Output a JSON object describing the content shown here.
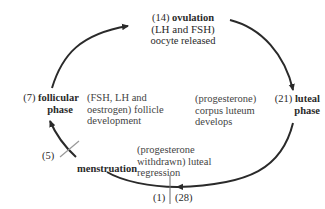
{
  "diagram": {
    "type": "cycle",
    "stages": [
      {
        "id": "ovulation",
        "day": "(14)",
        "name": "ovulation",
        "name_line2": "",
        "hormones": "(LH and FSH)",
        "description": "oocyte released"
      },
      {
        "id": "luteal",
        "day": "(21)",
        "name": "luteal",
        "name_line2": "phase",
        "hormones": "(progesterone)",
        "description_line1": "corpus luteum",
        "description_line2": "develops"
      },
      {
        "id": "menstruation",
        "day": "(1)",
        "day_end": "(28)",
        "name": "menstruation",
        "hormones_line1": "(progesterone",
        "hormones_line2": "withdrawn) luteal",
        "description": "regression"
      },
      {
        "id": "follicular",
        "day": "(7)",
        "name": "follicular",
        "name_line2": "phase",
        "hormones_line1": "(FSH, LH and",
        "hormones_line2": "oestrogen) follicle",
        "description": "development"
      }
    ],
    "markers": [
      {
        "label": "(5)",
        "position": "end of menstruation"
      },
      {
        "label": "(1)",
        "position": "start of cycle"
      },
      {
        "label": "(28)",
        "position": "end of cycle"
      }
    ],
    "colors": {
      "line": "#2a2a2a",
      "tick": "#9a9a9a",
      "text": "#2a2a2a"
    }
  }
}
